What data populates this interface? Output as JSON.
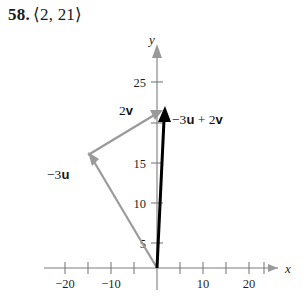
{
  "header": {
    "number": "58.",
    "vector_text": "⟨2, 21⟩"
  },
  "figure": {
    "axes": {
      "x_name": "x",
      "y_name": "y",
      "x_ticks": [
        -25,
        -20,
        -15,
        -10,
        -5,
        0,
        5,
        10,
        15,
        20,
        25
      ],
      "x_tick_labels": [
        "−20",
        "−10",
        "10",
        "20"
      ],
      "x_labeled_values": [
        -20,
        -10,
        10,
        20
      ],
      "y_ticks": [
        5,
        10,
        15,
        20,
        25
      ],
      "y_tick_labels": [
        "5",
        "10",
        "15",
        "25"
      ],
      "y_labeled_values": [
        5,
        10,
        15,
        25
      ],
      "x_range": [
        -27,
        28
      ],
      "y_range": [
        -2,
        30
      ]
    },
    "vectors": [
      {
        "name": "negative-3u",
        "label_html": "−3<b>u</b>",
        "color": "#9a9a9a",
        "start": [
          0,
          0
        ],
        "end": [
          -15,
          14
        ]
      },
      {
        "name": "2v",
        "label_html": "2<b>v</b>",
        "color": "#9a9a9a",
        "start": [
          -15,
          14
        ],
        "end": [
          2,
          21
        ]
      },
      {
        "name": "negative-3u-plus-2v",
        "label_html": "−3<b>u</b> + 2<b>v</b>",
        "color": "#000000",
        "start": [
          0,
          0
        ],
        "end": [
          2,
          21
        ]
      }
    ]
  },
  "chart_data": {
    "type": "scatter",
    "title": "58. ⟨2, 21⟩",
    "xlabel": "x",
    "ylabel": "y",
    "xlim": [
      -27,
      28
    ],
    "ylim": [
      -2,
      30
    ],
    "grid": false,
    "legend": "none",
    "series": [
      {
        "name": "−3u",
        "kind": "vector",
        "color": "#9a9a9a",
        "tail": [
          0,
          0
        ],
        "head": [
          -15,
          14
        ]
      },
      {
        "name": "2v",
        "kind": "vector",
        "color": "#9a9a9a",
        "tail": [
          -15,
          14
        ],
        "head": [
          2,
          21
        ]
      },
      {
        "name": "−3u + 2v",
        "kind": "vector",
        "color": "#000000",
        "tail": [
          0,
          0
        ],
        "head": [
          2,
          21
        ]
      }
    ],
    "annotations": [
      {
        "text": "2v",
        "x": -6,
        "y": 23
      },
      {
        "text": "−3u + 2v",
        "x": 4,
        "y": 20
      },
      {
        "text": "−3u",
        "x": -22,
        "y": 11
      }
    ]
  }
}
